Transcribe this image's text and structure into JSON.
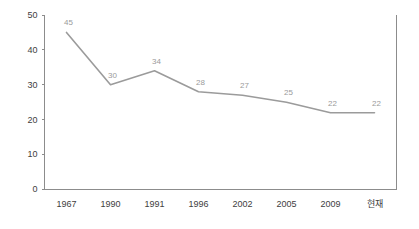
{
  "chart_data": {
    "type": "line",
    "title": "",
    "subtitle": "",
    "xlabel": "",
    "ylabel": "",
    "categories": [
      "1967",
      "1990",
      "1991",
      "1996",
      "2002",
      "2005",
      "2009",
      "현재"
    ],
    "values": [
      45,
      30,
      34,
      28,
      27,
      25,
      22,
      22
    ],
    "series": [
      {
        "name": "",
        "values": [
          45,
          30,
          34,
          28,
          27,
          25,
          22,
          22
        ]
      }
    ],
    "data_labels": [
      "45",
      "30",
      "34",
      "28",
      "27",
      "25",
      "22",
      "22"
    ],
    "ylim": [
      0,
      50
    ],
    "y_ticks": [
      0,
      10,
      20,
      30,
      40,
      50
    ],
    "y_tick_labels": [
      "0",
      "10",
      "20",
      "30",
      "40",
      "50"
    ],
    "grid": false,
    "legend": false,
    "legend_position": "none",
    "colors": {
      "line": "#9b9b9b",
      "axis": "#8c8c8c",
      "tick_text": "#404040",
      "data_label": "#9a9a9a",
      "background": "#ffffff"
    }
  }
}
